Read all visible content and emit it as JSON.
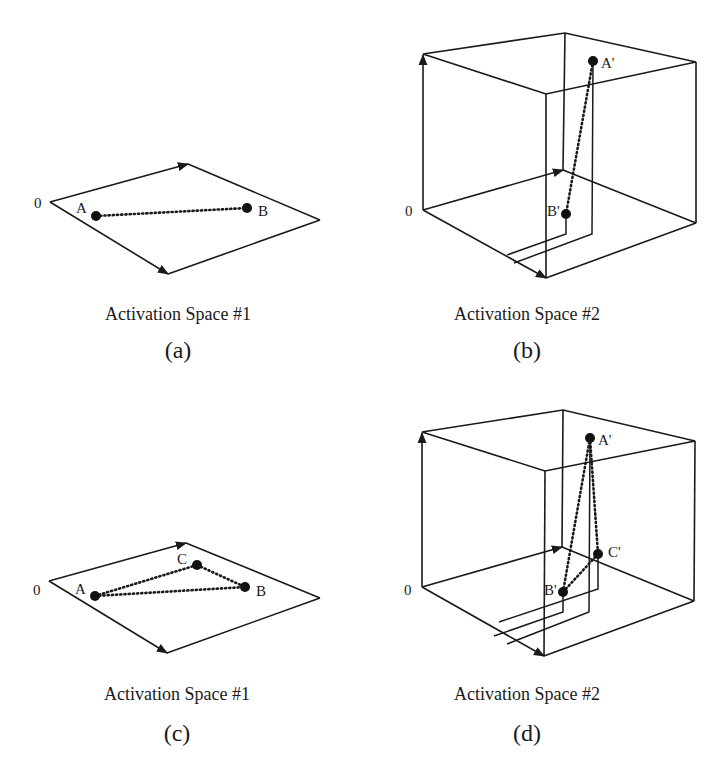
{
  "panels": {
    "a": {
      "caption": "Activation Space #1",
      "sublabel": "(a)",
      "origin_label": "0",
      "points": [
        {
          "label": "A",
          "x": 96,
          "y": 216
        },
        {
          "label": "B",
          "x": 247,
          "y": 208
        }
      ]
    },
    "b": {
      "caption": "Activation Space #2",
      "sublabel": "(b)",
      "origin_label": "0",
      "points": [
        {
          "label": "A'",
          "x": 593,
          "y": 61
        },
        {
          "label": "B'",
          "x": 566,
          "y": 214
        }
      ]
    },
    "c": {
      "caption": "Activation Space #1",
      "sublabel": "(c)",
      "origin_label": "0",
      "points": [
        {
          "label": "A",
          "x": 95,
          "y": 596
        },
        {
          "label": "B",
          "x": 245,
          "y": 587
        },
        {
          "label": "C",
          "x": 197,
          "y": 565
        }
      ]
    },
    "d": {
      "caption": "Activation Space #2",
      "sublabel": "(d)",
      "origin_label": "0",
      "points": [
        {
          "label": "A'",
          "x": 590,
          "y": 438
        },
        {
          "label": "B'",
          "x": 563,
          "y": 592
        },
        {
          "label": "C'",
          "x": 598,
          "y": 554
        }
      ]
    }
  },
  "colors": {
    "line": "#1a1a1a",
    "background": "#ffffff"
  }
}
